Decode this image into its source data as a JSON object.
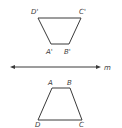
{
  "diagram": {
    "type": "reflection",
    "line": {
      "label": "m"
    },
    "image_trapezoid": {
      "vertices": [
        {
          "name": "D'",
          "x": 38,
          "y": 18
        },
        {
          "name": "C'",
          "x": 81,
          "y": 18
        },
        {
          "name": "B'",
          "x": 69,
          "y": 44
        },
        {
          "name": "A'",
          "x": 51,
          "y": 44
        }
      ],
      "labels": {
        "D": "D'",
        "C": "C'",
        "A": "A'",
        "B": "B'"
      }
    },
    "preimage_trapezoid": {
      "vertices": [
        {
          "name": "A",
          "x": 52,
          "y": 88
        },
        {
          "name": "B",
          "x": 70,
          "y": 88
        },
        {
          "name": "C",
          "x": 82,
          "y": 120
        },
        {
          "name": "D",
          "x": 38,
          "y": 120
        }
      ],
      "labels": {
        "A": "A",
        "B": "B",
        "C": "C",
        "D": "D"
      }
    },
    "colors": {
      "stroke": "#3a3a3a",
      "background": "#ffffff"
    }
  }
}
